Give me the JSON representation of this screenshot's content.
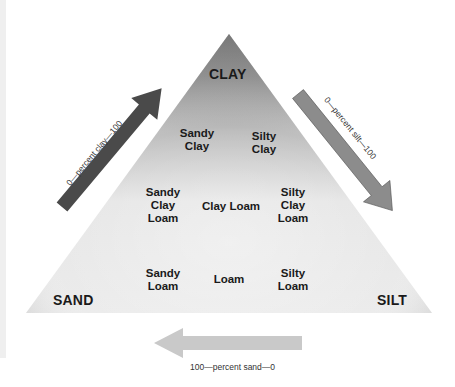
{
  "diagram": {
    "corners": {
      "top": "CLAY",
      "bottom_left": "SAND",
      "bottom_right": "SILT"
    },
    "regions": [
      {
        "id": "sandy-clay",
        "label": "Sandy\nClay"
      },
      {
        "id": "silty-clay",
        "label": "Silty\nClay"
      },
      {
        "id": "sandy-clay-loam",
        "label": "Sandy\nClay\nLoam"
      },
      {
        "id": "clay-loam",
        "label": "Clay Loam"
      },
      {
        "id": "silty-clay-loam",
        "label": "Silty\nClay\nLoam"
      },
      {
        "id": "sandy-loam",
        "label": "Sandy\nLoam"
      },
      {
        "id": "loam",
        "label": "Loam"
      },
      {
        "id": "silty-loam",
        "label": "Silty\nLoam"
      }
    ],
    "axes": {
      "clay": {
        "label": "0—percent clay—100",
        "arrow_color": "#4a4a4a"
      },
      "silt": {
        "label": "0—percent silt—100",
        "arrow_color": "#8c8c8c"
      },
      "sand": {
        "label": "100—percent sand—0",
        "arrow_color": "#c9c9c9"
      }
    },
    "colors": {
      "triangle_top": "#6e6e6e",
      "triangle_mid": "#d8d8d8",
      "triangle_light": "#eeeeee",
      "triangle_bottom": "#c4c4c4"
    }
  }
}
